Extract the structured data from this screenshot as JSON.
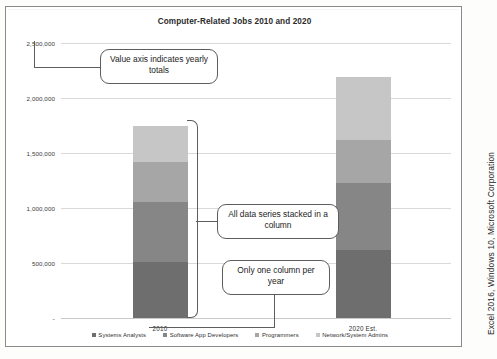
{
  "figure": {
    "title": "Computer-Related Jobs 2010 and 2020",
    "source_caption": "Excel 2016, Windows 10, Microsoft Corporation"
  },
  "axis": {
    "y_ticks": [
      "2,500,000",
      "2,000,000",
      "1,500,000",
      "1,000,000",
      "500,000",
      "-"
    ],
    "x_labels": [
      "2010",
      "2020 Est."
    ]
  },
  "legend": {
    "items": [
      {
        "label": "Systems Analysts",
        "color": "#6e6e6e"
      },
      {
        "label": "Software App Developers",
        "color": "#868686"
      },
      {
        "label": "Programmers",
        "color": "#a6a6a6"
      },
      {
        "label": "Network/System Admins",
        "color": "#c6c6c6"
      }
    ]
  },
  "callouts": [
    {
      "id": "value-axis",
      "text": "Value axis indicates yearly totals"
    },
    {
      "id": "stacked-series",
      "text": "All data series stacked in a column"
    },
    {
      "id": "one-column",
      "text": "Only one column per year"
    }
  ],
  "chart_data": {
    "type": "bar",
    "subtype": "stacked-column",
    "title": "Computer-Related Jobs 2010 and 2020",
    "xlabel": "",
    "ylabel": "",
    "categories": [
      "2010",
      "2020 Est."
    ],
    "ylim": [
      0,
      2500000
    ],
    "ytick_values": [
      0,
      500000,
      1000000,
      1500000,
      2000000,
      2500000
    ],
    "ytick_labels": [
      "-",
      "500,000",
      "1,000,000",
      "1,500,000",
      "2,000,000",
      "2,500,000"
    ],
    "grid": true,
    "legend_position": "bottom",
    "series": [
      {
        "name": "Systems Analysts",
        "color": "#6e6e6e",
        "values": [
          510000,
          620000
        ]
      },
      {
        "name": "Software App Developers",
        "color": "#868686",
        "values": [
          545000,
          610000
        ]
      },
      {
        "name": "Programmers",
        "color": "#a6a6a6",
        "values": [
          365000,
          390000
        ]
      },
      {
        "name": "Network/System Admins",
        "color": "#c6c6c6",
        "values": [
          330000,
          570000
        ]
      }
    ],
    "totals": [
      1750000,
      2190000
    ]
  }
}
